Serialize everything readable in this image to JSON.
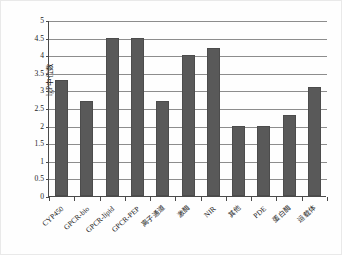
{
  "chart_data": {
    "type": "bar",
    "title": "",
    "xlabel": "",
    "ylabel": "lgP中位数",
    "ylim": [
      0,
      5
    ],
    "ytick_step": 0.5,
    "grid": true,
    "legend": "none",
    "bar_color": "#595959",
    "categories": [
      "CYP450",
      "GPCR-bio",
      "GPCR-lipid",
      "GPCR-PEP",
      "离子通道",
      "激酶",
      "NIR",
      "其他",
      "PDE",
      "蛋白酶",
      "运载体"
    ],
    "values": [
      3.3,
      2.7,
      4.5,
      4.5,
      2.7,
      4.0,
      4.2,
      2.0,
      2.0,
      2.3,
      3.1
    ],
    "ytick_labels": [
      "0",
      "0.5",
      "1",
      "1.5",
      "2",
      "2.5",
      "3",
      "3.5",
      "4",
      "4.5",
      "5"
    ],
    "ytick_values": [
      0,
      0.5,
      1,
      1.5,
      2,
      2.5,
      3,
      3.5,
      4,
      4.5,
      5
    ]
  }
}
